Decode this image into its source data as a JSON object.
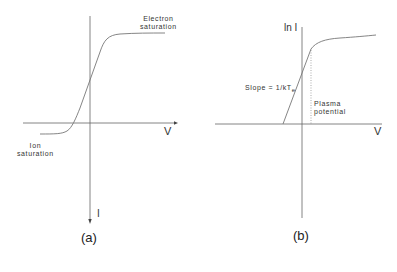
{
  "panel_a": {
    "caption": "(a)",
    "x_axis_label": "V",
    "y_axis_label": "I",
    "annotations": {
      "electron_saturation_line1": "Electron",
      "electron_saturation_line2": "saturation",
      "ion_saturation_line1": "Ion",
      "ion_saturation_line2": "saturation"
    }
  },
  "panel_b": {
    "caption": "(b)",
    "x_axis_label": "V",
    "y_axis_label": "ln I",
    "annotations": {
      "slope": "Slope = 1/kT",
      "slope_subscript": "e",
      "plasma_potential_line1": "Plasma",
      "plasma_potential_line2": "potential"
    }
  },
  "colors": {
    "line": "#555555",
    "text": "#333333",
    "background": "#ffffff"
  }
}
